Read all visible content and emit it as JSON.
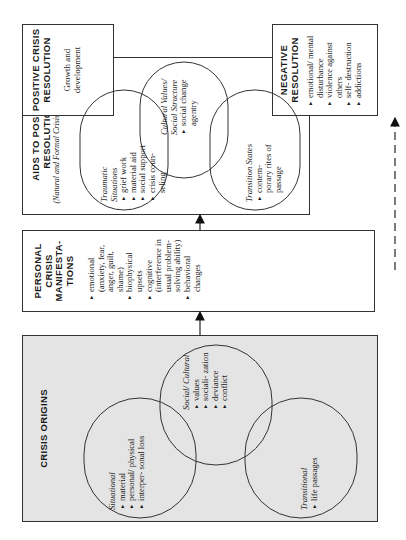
{
  "diagram": {
    "orientation": "rotated 90 degrees counterclockwise",
    "crisis_origins": {
      "title": "CRISIS ORIGINS",
      "groups": [
        {
          "label": "Situational",
          "items": [
            "material",
            "personal/ physical",
            "interper- sonal loss"
          ]
        },
        {
          "label": "Social/ Cultural",
          "items": [
            "values",
            "sociali- zation",
            "deviance",
            "conflict"
          ]
        },
        {
          "label": "Transitional",
          "items": [
            "life passages"
          ]
        }
      ]
    },
    "personal_manifestations": {
      "title": "PERSONAL CRISIS MANIFESTA- TIONS",
      "items": [
        "emotional (anxiety, fear, anger, guilt, shame)",
        "biophysical upsets",
        "cognitive (interference in usual problem- solving ability)",
        "behavioral changes"
      ]
    },
    "aids": {
      "title": "AIDS TO POSITIVE RESOLUTION",
      "subtitle": "(Natural and Formal Crisis Management)",
      "groups": [
        {
          "label": "Traumatic Situations",
          "items": [
            "grief work",
            "material aid",
            "social support",
            "crisis coun- seling"
          ]
        },
        {
          "label": "Cultural Values/ Social Structure",
          "items": [
            "social change agentry"
          ]
        },
        {
          "label": "Transition States",
          "items": [
            "contem- porary rites of passage"
          ]
        }
      ]
    },
    "positive_resolution": {
      "title": "POSITIVE CRISIS RESOLUTION",
      "text": "Growth and development"
    },
    "negative_resolution": {
      "title": "NEGATIVE RESOLUTION",
      "items": [
        "emotional/ mental disturbance",
        "violence against others",
        "self- destruction",
        "addictions"
      ]
    },
    "connectors": [
      {
        "from": "crisis_origins",
        "to": "personal_manifestations",
        "style": "solid-arrow"
      },
      {
        "from": "personal_manifestations",
        "to": "aids",
        "style": "solid-arrow"
      },
      {
        "from": "aids",
        "to": "positive_resolution",
        "style": "solid-arrow"
      },
      {
        "from": "personal_manifestations",
        "to": "negative_resolution",
        "style": "dashed-arrow"
      }
    ]
  }
}
